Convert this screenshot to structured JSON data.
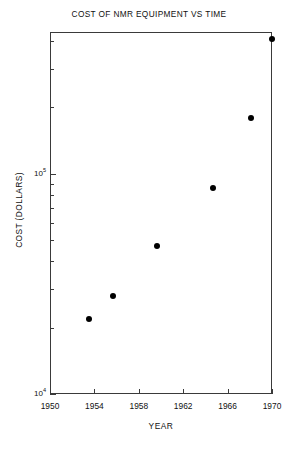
{
  "chart_data": {
    "type": "scatter",
    "title": "COST OF NMR EQUIPMENT VS TIME",
    "xlabel": "YEAR",
    "ylabel": "COST (DOLLARS)",
    "xscale": "linear",
    "yscale": "log",
    "xlim": [
      1950,
      1970
    ],
    "ylim": [
      10000,
      440000
    ],
    "grid": false,
    "legend": null,
    "xticks": [
      1950,
      1954,
      1958,
      1962,
      1966,
      1970
    ],
    "xtick_labels": [
      "1950",
      "1954",
      "1958",
      "1962",
      "1966",
      "1970"
    ],
    "yticks": [
      10000,
      100000
    ],
    "ytick_labels": [
      "10⁴",
      "10⁵"
    ],
    "ytick_label_parts": [
      {
        "base": "10",
        "exp": "4"
      },
      {
        "base": "10",
        "exp": "5"
      }
    ],
    "x": [
      1953.5,
      1955.7,
      1959.6,
      1964.7,
      1968.1,
      1970.0
    ],
    "y": [
      22000,
      28000,
      47000,
      86000,
      180000,
      410000
    ],
    "points": [
      {
        "year": 1953.5,
        "cost": 22000
      },
      {
        "year": 1955.7,
        "cost": 28000
      },
      {
        "year": 1959.6,
        "cost": 47000
      },
      {
        "year": 1964.7,
        "cost": 86000
      },
      {
        "year": 1968.1,
        "cost": 180000
      },
      {
        "year": 1970.0,
        "cost": 410000
      }
    ],
    "marker": "filled-circle",
    "marker_color": "#000000",
    "axis_color": "#3a3a3a",
    "background_color": "#ffffff"
  }
}
